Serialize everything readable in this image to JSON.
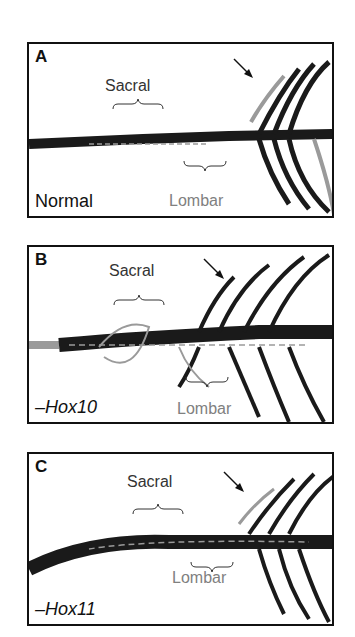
{
  "colors": {
    "dark": "#1a1a1a",
    "gray": "#9a9a9a",
    "label_gray": "#808080",
    "border": "#111111"
  },
  "panels": [
    {
      "letter": "A",
      "condition": "Normal",
      "condition_italic": false,
      "sacral_label": "Sacral",
      "lumbar_label": "Lombar",
      "arrow": true
    },
    {
      "letter": "B",
      "condition": "–Hox10",
      "condition_italic": true,
      "sacral_label": "Sacral",
      "lumbar_label": "Lombar",
      "arrow": true
    },
    {
      "letter": "C",
      "condition": "–Hox11",
      "condition_italic": true,
      "sacral_label": "Sacral",
      "lumbar_label": "Lombar",
      "arrow": true
    }
  ]
}
